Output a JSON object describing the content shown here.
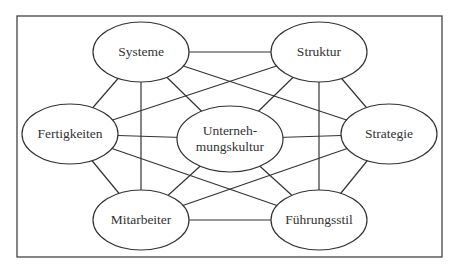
{
  "diagram": {
    "type": "network",
    "title": "",
    "colors": {
      "line": "#333333",
      "text": "#333333",
      "background": "#ffffff",
      "frame": "#444444"
    },
    "nodes": [
      {
        "id": "systeme",
        "label": "Systeme",
        "cx": 141,
        "cy": 52,
        "rx": 48,
        "ry": 30
      },
      {
        "id": "struktur",
        "label": "Struktur",
        "cx": 319,
        "cy": 52,
        "rx": 48,
        "ry": 30
      },
      {
        "id": "fertigkeiten",
        "label": "Fertigkeiten",
        "cx": 70,
        "cy": 134,
        "rx": 48,
        "ry": 30
      },
      {
        "id": "unternehmungskultur",
        "label_line1": "Unterneh-",
        "label_line2": "mungskultur",
        "cx": 230,
        "cy": 139,
        "rx": 53,
        "ry": 33
      },
      {
        "id": "strategie",
        "label": "Strategie",
        "cx": 389,
        "cy": 134,
        "rx": 48,
        "ry": 30
      },
      {
        "id": "mitarbeiter",
        "label": "Mitarbeiter",
        "cx": 141,
        "cy": 220,
        "rx": 48,
        "ry": 30
      },
      {
        "id": "fuehrungsstil",
        "label": "Führungsstil",
        "cx": 319,
        "cy": 220,
        "rx": 48,
        "ry": 30
      }
    ],
    "edges": [
      [
        "systeme",
        "struktur"
      ],
      [
        "systeme",
        "fertigkeiten"
      ],
      [
        "systeme",
        "mitarbeiter"
      ],
      [
        "systeme",
        "unternehmungskultur"
      ],
      [
        "systeme",
        "strategie"
      ],
      [
        "struktur",
        "fertigkeiten"
      ],
      [
        "struktur",
        "unternehmungskultur"
      ],
      [
        "struktur",
        "strategie"
      ],
      [
        "struktur",
        "fuehrungsstil"
      ],
      [
        "fertigkeiten",
        "unternehmungskultur"
      ],
      [
        "fertigkeiten",
        "mitarbeiter"
      ],
      [
        "fertigkeiten",
        "fuehrungsstil"
      ],
      [
        "strategie",
        "unternehmungskultur"
      ],
      [
        "strategie",
        "mitarbeiter"
      ],
      [
        "strategie",
        "fuehrungsstil"
      ],
      [
        "mitarbeiter",
        "unternehmungskultur"
      ],
      [
        "mitarbeiter",
        "fuehrungsstil"
      ],
      [
        "fuehrungsstil",
        "unternehmungskultur"
      ]
    ]
  }
}
